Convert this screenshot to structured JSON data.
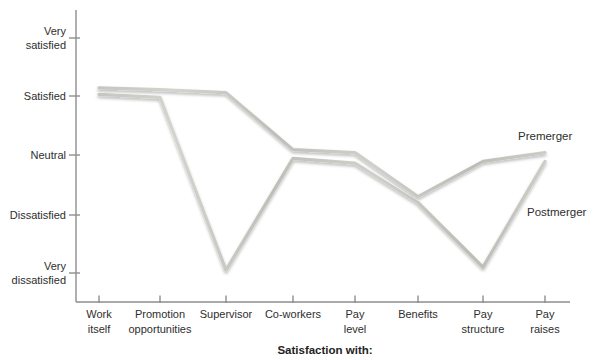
{
  "chart_data": {
    "type": "line",
    "title": "",
    "xlabel": "Satisfaction with:",
    "ylabel": "",
    "categories": [
      "Work itself",
      "Promotion opportunities",
      "Supervisor",
      "Co-workers",
      "Pay level",
      "Benefits",
      "Pay structure",
      "Pay raises"
    ],
    "y_tick_labels": [
      "Very satisfied",
      "Satisfied",
      "Neutral",
      "Dissatisfied",
      "Very dissatisfied"
    ],
    "y_scale_mapping": {
      "Very satisfied": 5,
      "Satisfied": 4,
      "Neutral": 3,
      "Dissatisfied": 2,
      "Very dissatisfied": 1
    },
    "ylim": [
      1,
      5
    ],
    "grid": false,
    "legend_position": "inline-right-of-lines",
    "series": [
      {
        "name": "Premerger",
        "values": [
          4.15,
          4.12,
          4.07,
          3.1,
          3.05,
          2.3,
          2.9,
          3.05
        ]
      },
      {
        "name": "Postmerger",
        "values": [
          4.04,
          3.99,
          1.05,
          2.95,
          2.87,
          2.2,
          1.1,
          2.9
        ]
      }
    ],
    "colors": {
      "line": "#c6c6c0",
      "axis": "#8e8e8e",
      "text": "#2e2e2e"
    }
  },
  "display": {
    "y_ticks": [
      "Very\nsatisfied",
      "Satisfied",
      "Neutral",
      "Dissatisfied",
      "Very\ndissatisfied"
    ],
    "x_ticks": [
      "Work\nitself",
      "Promotion\nopportunities",
      "Supervisor",
      "Co-workers",
      "Pay\nlevel",
      "Benefits",
      "Pay\nstructure",
      "Pay\nraises"
    ],
    "series_labels": {
      "premerger": "Premerger",
      "postmerger": "Postmerger"
    },
    "bottom_title": "Satisfaction with:"
  }
}
